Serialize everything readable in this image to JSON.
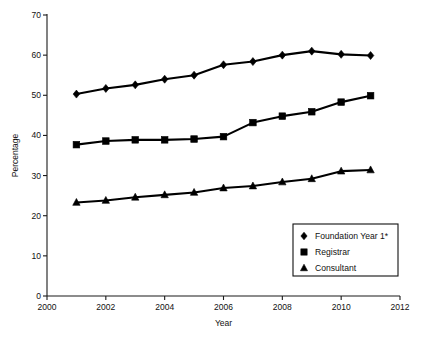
{
  "chart_data": {
    "type": "line",
    "title": "",
    "xlabel": "Year",
    "ylabel": "Percentage",
    "x": [
      2001,
      2002,
      2003,
      2004,
      2005,
      2006,
      2007,
      2008,
      2009,
      2010,
      2011
    ],
    "xlim": [
      2000,
      2012
    ],
    "ylim": [
      0,
      70
    ],
    "xticks": [
      2000,
      2002,
      2004,
      2006,
      2008,
      2010,
      2012
    ],
    "xtick_labels": [
      "2000",
      "2002",
      "2004",
      "2006",
      "2008",
      "2010",
      "2012"
    ],
    "yticks": [
      0,
      10,
      20,
      30,
      40,
      50,
      60,
      70
    ],
    "ytick_labels": [
      "0",
      "10",
      "20",
      "30",
      "40",
      "50",
      "60",
      "70"
    ],
    "grid": false,
    "legend_position": "lower right",
    "series": [
      {
        "name": "Foundation Year 1*",
        "marker": "diamond",
        "values": [
          50.3,
          51.7,
          52.6,
          54.0,
          55.0,
          57.6,
          58.4,
          60.0,
          61.0,
          60.2,
          59.9
        ]
      },
      {
        "name": "Registrar",
        "marker": "square",
        "values": [
          37.7,
          38.6,
          38.9,
          38.9,
          39.1,
          39.7,
          43.2,
          44.8,
          45.9,
          48.3,
          49.9
        ]
      },
      {
        "name": "Consultant",
        "marker": "triangle",
        "values": [
          23.3,
          23.8,
          24.6,
          25.2,
          25.8,
          26.9,
          27.4,
          28.4,
          29.2,
          31.1,
          31.4
        ]
      }
    ]
  },
  "axes": {
    "y_title": "Percentage",
    "x_title": "Year"
  },
  "legend": {
    "entries": [
      {
        "label": "Foundation Year 1*",
        "marker": "diamond-marker"
      },
      {
        "label": "Registrar",
        "marker": "square-marker"
      },
      {
        "label": "Consultant",
        "marker": "triangle-marker"
      }
    ]
  },
  "colors": {
    "ink": "#000000",
    "axis": "#1a1a1a",
    "background": "#ffffff"
  }
}
